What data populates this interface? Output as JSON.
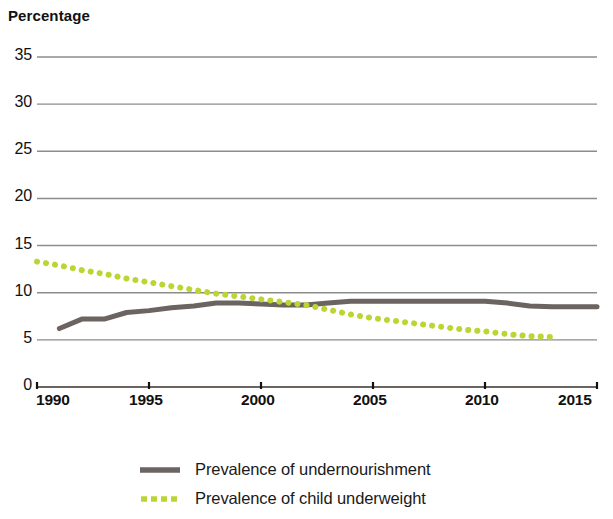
{
  "chart_data": {
    "type": "line",
    "title": "",
    "subtitle": "",
    "xlabel": "",
    "ylabel": "Percentage",
    "xlim": [
      1990,
      2015
    ],
    "ylim": [
      0,
      35
    ],
    "grid": true,
    "grid_axis": "y",
    "legend_position": "bottom",
    "y_ticks": [
      35,
      30,
      25,
      20,
      15,
      10,
      5,
      0
    ],
    "y_tick_labels": [
      "35",
      "30",
      "25",
      "20",
      "15",
      "10",
      "5",
      "0"
    ],
    "x_ticks": [
      1990,
      1995,
      2000,
      2005,
      2010,
      2015
    ],
    "x_tick_labels": [
      "1990",
      "1995",
      "2000",
      "2005",
      "2010",
      "2015"
    ],
    "series": [
      {
        "name": "Prevalence of undernourishment",
        "style": "solid",
        "color": "#6b6460",
        "linewidth": 5,
        "x": [
          1991,
          1992,
          1993,
          1994,
          1995,
          1996,
          1997,
          1998,
          1999,
          2000,
          2001,
          2002,
          2003,
          2004,
          2005,
          2006,
          2007,
          2008,
          2009,
          2010,
          2011,
          2012,
          2013,
          2014,
          2015
        ],
        "values": [
          6.2,
          7.2,
          7.2,
          7.9,
          8.1,
          8.4,
          8.6,
          8.9,
          8.9,
          8.8,
          8.7,
          8.7,
          8.9,
          9.1,
          9.1,
          9.1,
          9.1,
          9.1,
          9.1,
          9.1,
          8.9,
          8.6,
          8.5,
          8.5,
          8.5
        ]
      },
      {
        "name": "Prevalence of child underweight",
        "style": "dotted",
        "color": "#bdd533",
        "linewidth": 5,
        "x": [
          1990,
          1991,
          1992,
          1993,
          1994,
          1995,
          1996,
          1997,
          1998,
          1999,
          2000,
          2001,
          2002,
          2003,
          2004,
          2005,
          2006,
          2007,
          2008,
          2009,
          2010,
          2011,
          2012,
          2013
        ],
        "values": [
          13.3,
          12.9,
          12.4,
          12.0,
          11.5,
          11.1,
          10.7,
          10.3,
          9.9,
          9.6,
          9.3,
          9.0,
          8.7,
          8.2,
          7.7,
          7.3,
          7.0,
          6.7,
          6.4,
          6.1,
          5.9,
          5.6,
          5.4,
          5.3
        ]
      }
    ]
  },
  "axis": {
    "y_title": "Percentage"
  },
  "legend": {
    "items": [
      {
        "label": "Prevalence of undernourishment",
        "color": "#6b6460",
        "style": "solid",
        "icon": "solid-line-swatch"
      },
      {
        "label": "Prevalence of child underweight",
        "color": "#bdd533",
        "style": "dotted",
        "icon": "dotted-line-swatch"
      }
    ]
  },
  "colors": {
    "undernourishment": "#6b6460",
    "child_underweight": "#bdd533",
    "gridline": "#8c8c8c",
    "axis": "#6b6460",
    "text": "#1a1a1a"
  }
}
